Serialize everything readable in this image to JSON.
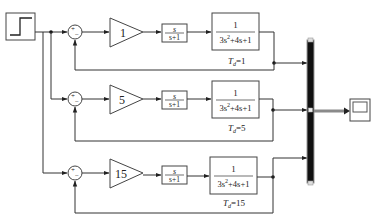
{
  "diagram": {
    "type": "simulink-block-diagram",
    "source": {
      "name": "step",
      "icon": "step-icon"
    },
    "sum_signs": {
      "plus": "+",
      "minus": "−"
    },
    "rows": [
      {
        "gain": "1",
        "derivative": {
          "num": "s",
          "den": "s+1"
        },
        "plant": {
          "num": "1",
          "den_a": "3s",
          "den_sup": "2",
          "den_b": "+4s+1"
        },
        "label": {
          "T": "T",
          "sub": "d",
          "value": "=1"
        }
      },
      {
        "gain": "5",
        "derivative": {
          "num": "s",
          "den": "s+1"
        },
        "plant": {
          "num": "1",
          "den_a": "3s",
          "den_sup": "2",
          "den_b": "+4s+1"
        },
        "label": {
          "T": "T",
          "sub": "d",
          "value": "=5"
        }
      },
      {
        "gain": "15",
        "derivative": {
          "num": "s",
          "den": "s+1"
        },
        "plant": {
          "num": "1",
          "den_a": "3s",
          "den_sup": "2",
          "den_b": "+4s+1"
        },
        "label": {
          "T": "T",
          "sub": "d",
          "value": "=15"
        }
      }
    ],
    "mux": {
      "name": "mux",
      "inputs": 3
    },
    "sink": {
      "name": "scope",
      "icon": "scope-icon"
    },
    "colors": {
      "line": "#333333",
      "mux": "#111111",
      "mux_output": "#888888"
    }
  }
}
